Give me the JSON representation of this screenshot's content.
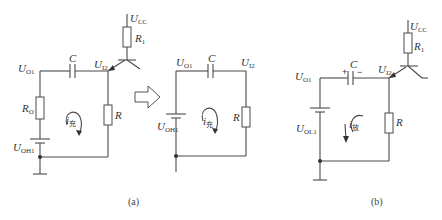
{
  "figure": {
    "captions": {
      "a": "(a)",
      "b": "(b)"
    },
    "circuit_a_left": {
      "labels": {
        "ucc": "U",
        "ucc_sub": "CC",
        "r1": "R",
        "r1_sub": "1",
        "uo1": "U",
        "uo1_sub": "O1",
        "c": "C",
        "ui2": "U",
        "ui2_sub": "I2",
        "ro": "R",
        "ro_sub": "O",
        "r": "R",
        "uoh1": "U",
        "uoh1_sub": "OH1",
        "current": "i",
        "current_sub": "充"
      }
    },
    "arrow": "⇨",
    "circuit_a_right": {
      "labels": {
        "uo1": "U",
        "uo1_sub": "O1",
        "c": "C",
        "ui2": "U",
        "ui2_sub": "I2",
        "r": "R",
        "uoh1": "U",
        "uoh1_sub": "OH1",
        "current": "i",
        "current_sub": "充"
      }
    },
    "circuit_b": {
      "labels": {
        "ucc": "U",
        "ucc_sub": "CC",
        "r1": "R",
        "r1_sub": "1",
        "uo1": "U",
        "uo1_sub": "O1",
        "c": "C",
        "plus": "+",
        "minus": "−",
        "ui2": "U",
        "ui2_sub": "I2",
        "r": "R",
        "uol1": "U",
        "uol1_sub": "OL1",
        "current": "i",
        "current_sub": "放"
      }
    }
  }
}
